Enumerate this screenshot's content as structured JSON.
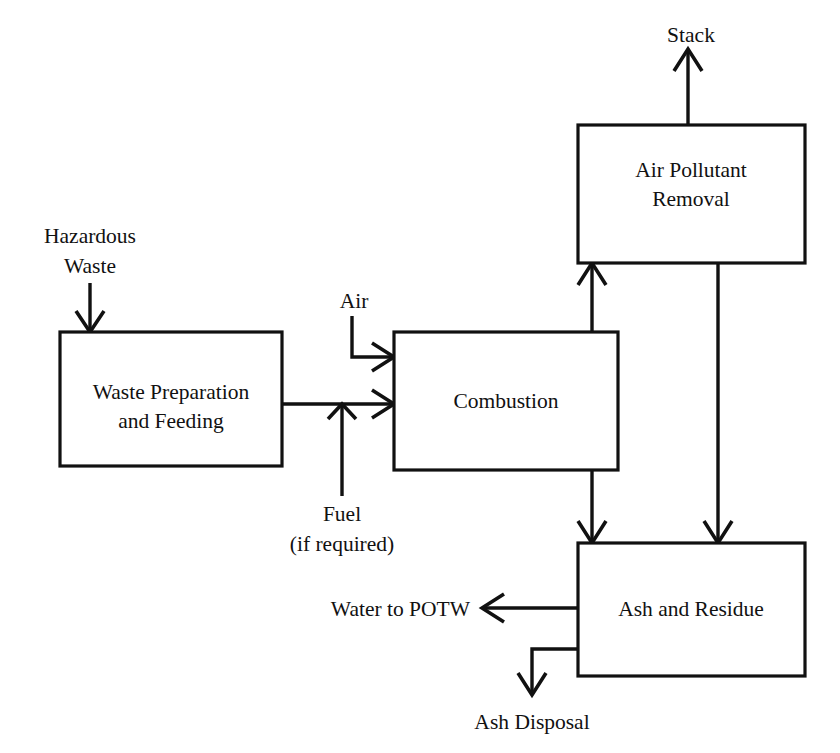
{
  "diagram": {
    "colors": {
      "background": "#ffffff",
      "stroke": "#111111",
      "node_fill": "#ffffff"
    },
    "nodes": [
      {
        "id": "waste-preparation",
        "lines": [
          "Waste Preparation",
          "and Feeding"
        ],
        "line1": "Waste Preparation",
        "line2": "and Feeding"
      },
      {
        "id": "combustion",
        "lines": [
          "Combustion"
        ],
        "line1": "Combustion",
        "line2": ""
      },
      {
        "id": "air-pollutant-removal",
        "lines": [
          "Air Pollutant",
          "Removal"
        ],
        "line1": "Air Pollutant",
        "line2": "Removal"
      },
      {
        "id": "ash-and-residue",
        "lines": [
          "Ash and Residue"
        ],
        "line1": "Ash and Residue",
        "line2": ""
      }
    ],
    "edge_labels": {
      "hazardous_waste_line1": "Hazardous",
      "hazardous_waste_line2": "Waste",
      "air": "Air",
      "fuel_line1": "Fuel",
      "fuel_line2": "(if required)",
      "stack": "Stack",
      "water_to_potw": "Water to POTW",
      "ash_disposal": "Ash Disposal"
    },
    "flows": [
      {
        "from": "Hazardous Waste",
        "to": "Waste Preparation and Feeding"
      },
      {
        "from": "Waste Preparation and Feeding",
        "to": "Combustion"
      },
      {
        "from": "Air",
        "to": "Combustion"
      },
      {
        "from": "Fuel (if required)",
        "to": "Combustion"
      },
      {
        "from": "Combustion",
        "to": "Air Pollutant Removal"
      },
      {
        "from": "Combustion",
        "to": "Ash and Residue"
      },
      {
        "from": "Air Pollutant Removal",
        "to": "Stack"
      },
      {
        "from": "Air Pollutant Removal",
        "to": "Ash and Residue"
      },
      {
        "from": "Ash and Residue",
        "to": "Water to POTW"
      },
      {
        "from": "Ash and Residue",
        "to": "Ash Disposal"
      }
    ]
  }
}
